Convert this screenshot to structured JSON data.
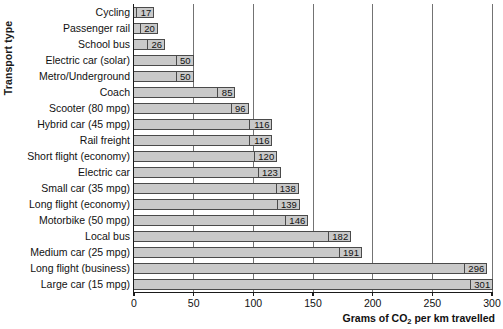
{
  "chart_data": {
    "type": "bar",
    "orientation": "horizontal",
    "title": "",
    "xlabel": "Grams of CO2 per km travelled",
    "xlabel_parts": {
      "before": "Grams of CO",
      "sub": "2",
      "after": " per km travelled"
    },
    "ylabel": "Transport type",
    "xlim": [
      0,
      300
    ],
    "xticks": [
      0,
      50,
      100,
      150,
      200,
      250,
      300
    ],
    "xtick_labels": [
      "0",
      "50",
      "100",
      "150",
      "200",
      "250",
      "300"
    ],
    "grid": "vertical",
    "legend": "none",
    "bar_color": "#c9c9c9",
    "bar_border_color": "#4a4a4a",
    "gridline_color": "#5a5a5a",
    "axis_color": "#1a1a1a",
    "categories": [
      "Cycling",
      "Passenger rail",
      "School bus",
      "Electric car (solar)",
      "Metro/Underground",
      "Coach",
      "Scooter (80 mpg)",
      "Hybrid car (45 mpg)",
      "Rail freight",
      "Short flight (economy)",
      "Electric car",
      "Small car (35 mpg)",
      "Long flight (economy)",
      "Motorbike (50 mpg)",
      "Local bus",
      "Medium car (25 mpg)",
      "Long flight (business)",
      "Large car (15 mpg)"
    ],
    "values": [
      17,
      20,
      26,
      50,
      50,
      85,
      96,
      116,
      116,
      120,
      123,
      138,
      139,
      146,
      182,
      191,
      296,
      301
    ],
    "value_labels": [
      "17",
      "20",
      "26",
      "50",
      "50",
      "85",
      "96",
      "116",
      "116",
      "120",
      "123",
      "138",
      "139",
      "146",
      "182",
      "191",
      "296",
      "301"
    ]
  }
}
